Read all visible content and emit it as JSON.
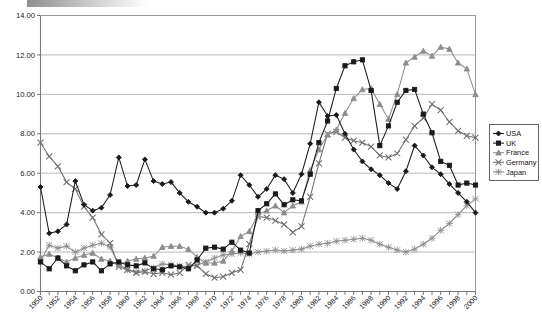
{
  "chart_data": {
    "type": "line",
    "title": "",
    "subtitle": "",
    "xlabel": "",
    "ylabel": "",
    "xlim": [
      1950,
      2000
    ],
    "ylim": [
      0.0,
      14.0
    ],
    "ytick_step": 2.0,
    "xtick_step": 2.0,
    "grid": true,
    "legend_position": "right",
    "ytick_labels": [
      "0.00",
      "2.00",
      "4.00",
      "6.00",
      "8.00",
      "10.00",
      "12.00",
      "14.00"
    ],
    "ytick_values": [
      0,
      2,
      4,
      6,
      8,
      10,
      12,
      14
    ],
    "xtick_labels": [
      "1950",
      "1952",
      "1954",
      "1956",
      "1958",
      "1960",
      "1962",
      "1964",
      "1966",
      "1968",
      "1970",
      "1972",
      "1974",
      "1976",
      "1978",
      "1980",
      "1982",
      "1984",
      "1986",
      "1988",
      "1990",
      "1992",
      "1994",
      "1996",
      "1998",
      "2000"
    ],
    "x": [
      1950,
      1951,
      1952,
      1953,
      1954,
      1955,
      1956,
      1957,
      1958,
      1959,
      1960,
      1961,
      1962,
      1963,
      1964,
      1965,
      1966,
      1967,
      1968,
      1969,
      1970,
      1971,
      1972,
      1973,
      1974,
      1975,
      1976,
      1977,
      1978,
      1979,
      1980,
      1981,
      1982,
      1983,
      1984,
      1985,
      1986,
      1987,
      1988,
      1989,
      1990,
      1991,
      1992,
      1993,
      1994,
      1995,
      1996,
      1997,
      1998,
      1999,
      2000
    ],
    "series": [
      {
        "name": "USA",
        "marker": "diamond",
        "color": "#1a1a1a",
        "values": [
          5.3,
          2.95,
          3.05,
          3.4,
          5.6,
          4.4,
          4.1,
          4.25,
          4.9,
          6.8,
          5.35,
          5.4,
          6.7,
          5.6,
          5.45,
          5.55,
          5.0,
          4.55,
          4.3,
          4.0,
          4.0,
          4.2,
          4.6,
          5.9,
          5.4,
          4.8,
          5.2,
          5.9,
          5.7,
          5.0,
          5.95,
          7.5,
          9.6,
          8.9,
          8.95,
          8.0,
          7.2,
          6.6,
          6.2,
          5.9,
          5.5,
          5.2,
          6.1,
          7.4,
          6.9,
          6.3,
          5.95,
          5.45,
          5.0,
          4.55,
          4.0
        ]
      },
      {
        "name": "UK",
        "marker": "square",
        "color": "#1a1a1a",
        "values": [
          1.5,
          1.15,
          1.7,
          1.3,
          1.05,
          1.35,
          1.5,
          1.05,
          1.4,
          1.5,
          1.35,
          1.3,
          1.45,
          1.15,
          1.1,
          1.3,
          1.25,
          1.15,
          1.6,
          2.2,
          2.25,
          2.15,
          2.5,
          2.1,
          1.95,
          4.1,
          4.45,
          4.95,
          4.4,
          4.65,
          4.6,
          5.95,
          7.55,
          8.65,
          10.3,
          11.45,
          11.65,
          11.75,
          10.2,
          7.4,
          8.4,
          9.6,
          10.2,
          10.25,
          9.0,
          8.05,
          6.6,
          6.4,
          5.4,
          5.5,
          5.4
        ]
      },
      {
        "name": "France",
        "marker": "triangle",
        "color": "#8d8d8d",
        "values": [
          1.75,
          1.9,
          1.7,
          1.5,
          1.7,
          1.85,
          1.95,
          1.65,
          1.55,
          1.35,
          1.55,
          1.65,
          1.7,
          1.8,
          2.25,
          2.3,
          2.3,
          2.15,
          1.75,
          1.45,
          1.45,
          1.55,
          2.05,
          2.8,
          3.05,
          3.9,
          4.1,
          4.35,
          4.0,
          4.35,
          4.55,
          6.15,
          7.2,
          7.95,
          8.2,
          9.05,
          9.8,
          10.25,
          10.3,
          9.5,
          8.75,
          10.0,
          11.6,
          11.9,
          12.2,
          11.95,
          12.4,
          12.3,
          11.6,
          11.3,
          10.0
        ]
      },
      {
        "name": "Germany",
        "marker": "x",
        "color": "#6f6f6f",
        "values": [
          7.55,
          6.85,
          6.35,
          5.55,
          5.2,
          4.3,
          3.75,
          2.9,
          2.45,
          1.25,
          1.1,
          0.95,
          1.0,
          0.9,
          0.95,
          0.85,
          0.95,
          1.35,
          1.3,
          0.9,
          0.7,
          0.75,
          0.95,
          1.1,
          2.4,
          3.8,
          3.75,
          3.6,
          3.4,
          3.0,
          3.3,
          4.8,
          6.5,
          8.0,
          8.1,
          7.8,
          7.65,
          7.55,
          7.35,
          6.9,
          6.8,
          7.0,
          7.7,
          8.4,
          8.8,
          9.5,
          9.2,
          8.6,
          8.15,
          7.9,
          7.8
        ]
      },
      {
        "name": "Japan",
        "marker": "asterisk",
        "color": "#8d8d8d",
        "values": [
          1.55,
          2.35,
          2.2,
          2.3,
          2.0,
          2.2,
          2.35,
          2.45,
          2.25,
          1.4,
          1.1,
          1.0,
          1.05,
          1.2,
          1.4,
          1.35,
          1.3,
          1.25,
          1.35,
          1.5,
          1.7,
          1.85,
          1.9,
          1.95,
          1.9,
          2.0,
          2.05,
          2.1,
          2.05,
          2.1,
          2.15,
          2.3,
          2.4,
          2.45,
          2.55,
          2.6,
          2.65,
          2.7,
          2.6,
          2.4,
          2.25,
          2.1,
          2.0,
          2.15,
          2.4,
          2.7,
          3.1,
          3.45,
          3.9,
          4.35,
          4.7
        ]
      }
    ]
  },
  "legend": {
    "items": [
      {
        "label": "USA"
      },
      {
        "label": "UK"
      },
      {
        "label": "France"
      },
      {
        "label": "Germany"
      },
      {
        "label": "Japan"
      }
    ]
  }
}
